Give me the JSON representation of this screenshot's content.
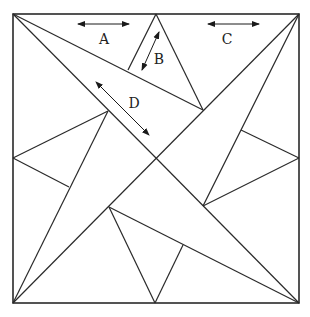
{
  "diagram": {
    "type": "geometric-quilt-block",
    "stroke_color": "#2a2a2a",
    "background": "#ffffff",
    "frame": {
      "x1": 13,
      "y1": 14,
      "x2": 299,
      "y2": 303
    },
    "labels": [
      {
        "id": "A",
        "text": "A",
        "x": 104,
        "y": 44
      },
      {
        "id": "B",
        "text": "B",
        "x": 159,
        "y": 64
      },
      {
        "id": "C",
        "text": "C",
        "x": 227,
        "y": 44
      },
      {
        "id": "D",
        "text": "D",
        "x": 134,
        "y": 108
      }
    ],
    "arrows": [
      {
        "id": "A",
        "from": [
          78,
          24
        ],
        "to": [
          129,
          24
        ]
      },
      {
        "id": "B",
        "from": [
          159,
          32
        ],
        "to": [
          142,
          70
        ]
      },
      {
        "id": "C",
        "from": [
          208,
          24
        ],
        "to": [
          259,
          24
        ]
      },
      {
        "id": "D",
        "from": [
          96,
          82
        ],
        "to": [
          149,
          135
        ]
      }
    ],
    "lines": [
      {
        "from": [
          13,
          14
        ],
        "to": [
          203,
          110
        ]
      },
      {
        "from": [
          13,
          14
        ],
        "to": [
          156,
          158
        ]
      },
      {
        "from": [
          299,
          14
        ],
        "to": [
          13,
          303
        ]
      },
      {
        "from": [
          299,
          14
        ],
        "to": [
          203,
          206
        ]
      },
      {
        "from": [
          156,
          14
        ],
        "to": [
          203,
          110
        ]
      },
      {
        "from": [
          156,
          14
        ],
        "to": [
          128,
          70
        ]
      },
      {
        "from": [
          13,
          158
        ],
        "to": [
          108,
          111
        ]
      },
      {
        "from": [
          13,
          158
        ],
        "to": [
          69,
          187
        ]
      },
      {
        "from": [
          108,
          111
        ],
        "to": [
          13,
          303
        ]
      },
      {
        "from": [
          299,
          158
        ],
        "to": [
          241,
          130
        ]
      },
      {
        "from": [
          299,
          158
        ],
        "to": [
          203,
          206
        ]
      },
      {
        "from": [
          156,
          158
        ],
        "to": [
          299,
          303
        ]
      },
      {
        "from": [
          109,
          207
        ],
        "to": [
          299,
          303
        ]
      },
      {
        "from": [
          109,
          207
        ],
        "to": [
          155,
          303
        ]
      },
      {
        "from": [
          183,
          245
        ],
        "to": [
          155,
          303
        ]
      }
    ]
  }
}
